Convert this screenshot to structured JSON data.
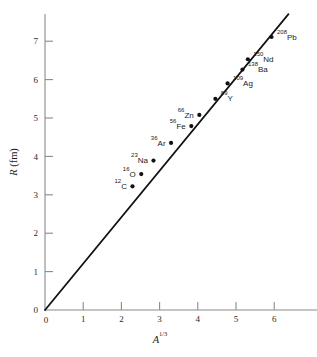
{
  "chart_data": {
    "type": "scatter",
    "title": "",
    "xlabel": "A^1/3",
    "xlabel_base": "A",
    "xlabel_exponent": "1/3",
    "ylabel": "R (fm)",
    "ylabel_symbol": "R",
    "ylabel_unit": "(fm)",
    "xlim": [
      0,
      7.1
    ],
    "ylim": [
      0,
      7.7
    ],
    "xticks": [
      0,
      1,
      2,
      3,
      4,
      5,
      6
    ],
    "yticks": [
      0,
      1,
      2,
      3,
      4,
      5,
      6,
      7
    ],
    "xticklabels": [
      "0",
      "1",
      "2",
      "3",
      "4",
      "5",
      "6"
    ],
    "yticklabels": [
      "0",
      "1",
      "2",
      "3",
      "4",
      "5",
      "6",
      "7"
    ],
    "grid": false,
    "legend": null,
    "origin_label": "0",
    "fit_line": {
      "type": "line",
      "through_origin": true,
      "slope": 1.21,
      "x_start": 0.0,
      "y_start": 0.0,
      "x_end": 6.37,
      "y_end": 7.7
    },
    "points": [
      {
        "label": "12C",
        "mass": "12",
        "element": "C",
        "x": 2.29,
        "y": 3.22,
        "label_side": "left"
      },
      {
        "label": "16O",
        "mass": "16",
        "element": "O",
        "x": 2.52,
        "y": 3.54,
        "label_side": "left"
      },
      {
        "label": "23Na",
        "mass": "23",
        "element": "Na",
        "x": 2.84,
        "y": 3.89,
        "label_side": "left"
      },
      {
        "label": "36Ar",
        "mass": "36",
        "element": "Ar",
        "x": 3.3,
        "y": 4.35,
        "label_side": "left"
      },
      {
        "label": "56Fe",
        "mass": "56",
        "element": "Fe",
        "x": 3.83,
        "y": 4.79,
        "label_side": "left"
      },
      {
        "label": "66Zn",
        "mass": "66",
        "element": "Zn",
        "x": 4.04,
        "y": 5.08,
        "label_side": "left"
      },
      {
        "label": "89Y",
        "mass": "89",
        "element": "Y",
        "x": 4.46,
        "y": 5.5,
        "label_side": "right"
      },
      {
        "label": "109Ag",
        "mass": "109",
        "element": "Ag",
        "x": 4.78,
        "y": 5.9,
        "label_side": "right"
      },
      {
        "label": "138Ba",
        "mass": "138",
        "element": "Ba",
        "x": 5.17,
        "y": 6.26,
        "label_side": "right"
      },
      {
        "label": "150Nd",
        "mass": "150",
        "element": "Nd",
        "x": 5.31,
        "y": 6.53,
        "label_side": "right"
      },
      {
        "label": "208Pb",
        "mass": "208",
        "element": "Pb",
        "x": 5.93,
        "y": 7.11,
        "label_side": "right"
      }
    ]
  }
}
